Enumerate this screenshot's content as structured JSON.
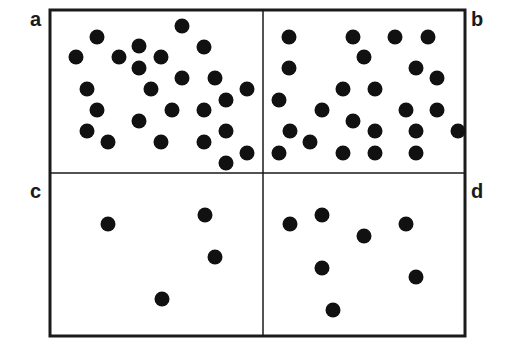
{
  "figure": {
    "type": "dot-density-quadrant-diagram",
    "frame": {
      "left": 50,
      "top": 10,
      "right": 465,
      "bottom": 336,
      "mid_x": 263,
      "mid_y": 173
    },
    "colors": {
      "dot": "#111111",
      "line": "#1a1a1a",
      "background": "#ffffff"
    },
    "dot_radius": 7.5,
    "panels": [
      {
        "id": "a",
        "label": "a",
        "label_pos": {
          "x": 30,
          "y": 10
        },
        "dots": [
          [
            182,
            26
          ],
          [
            97,
            37
          ],
          [
            204,
            47
          ],
          [
            139,
            46
          ],
          [
            119,
            57
          ],
          [
            76,
            57
          ],
          [
            161,
            57
          ],
          [
            139,
            68
          ],
          [
            182,
            78
          ],
          [
            215,
            78
          ],
          [
            87,
            89
          ],
          [
            151,
            89
          ],
          [
            247,
            89
          ],
          [
            226,
            100
          ],
          [
            97,
            110
          ],
          [
            172,
            110
          ],
          [
            204,
            110
          ],
          [
            139,
            121
          ],
          [
            87,
            131
          ],
          [
            226,
            131
          ],
          [
            108,
            142
          ],
          [
            161,
            142
          ],
          [
            204,
            142
          ],
          [
            247,
            153
          ],
          [
            226,
            163
          ]
        ]
      },
      {
        "id": "b",
        "label": "b",
        "label_pos": {
          "x": 472,
          "y": 10
        },
        "dots": [
          [
            289,
            37
          ],
          [
            353,
            37
          ],
          [
            395,
            37
          ],
          [
            428,
            37
          ],
          [
            364,
            57
          ],
          [
            289,
            68
          ],
          [
            416,
            68
          ],
          [
            343,
            89
          ],
          [
            437,
            78
          ],
          [
            279,
            100
          ],
          [
            375,
            89
          ],
          [
            322,
            110
          ],
          [
            406,
            110
          ],
          [
            437,
            110
          ],
          [
            353,
            121
          ],
          [
            290,
            131
          ],
          [
            375,
            131
          ],
          [
            416,
            131
          ],
          [
            458,
            131
          ],
          [
            310,
            142
          ],
          [
            279,
            153
          ],
          [
            343,
            153
          ],
          [
            375,
            153
          ],
          [
            416,
            153
          ]
        ]
      },
      {
        "id": "c",
        "label": "c",
        "label_pos": {
          "x": 30,
          "y": 183
        },
        "dots": [
          [
            108,
            224
          ],
          [
            205,
            215
          ],
          [
            215,
            257
          ],
          [
            162,
            299
          ]
        ]
      },
      {
        "id": "d",
        "label": "d",
        "label_pos": {
          "x": 472,
          "y": 183
        },
        "dots": [
          [
            290,
            224
          ],
          [
            322,
            215
          ],
          [
            364,
            236
          ],
          [
            406,
            224
          ],
          [
            322,
            268
          ],
          [
            416,
            277
          ],
          [
            333,
            310
          ]
        ]
      }
    ]
  }
}
